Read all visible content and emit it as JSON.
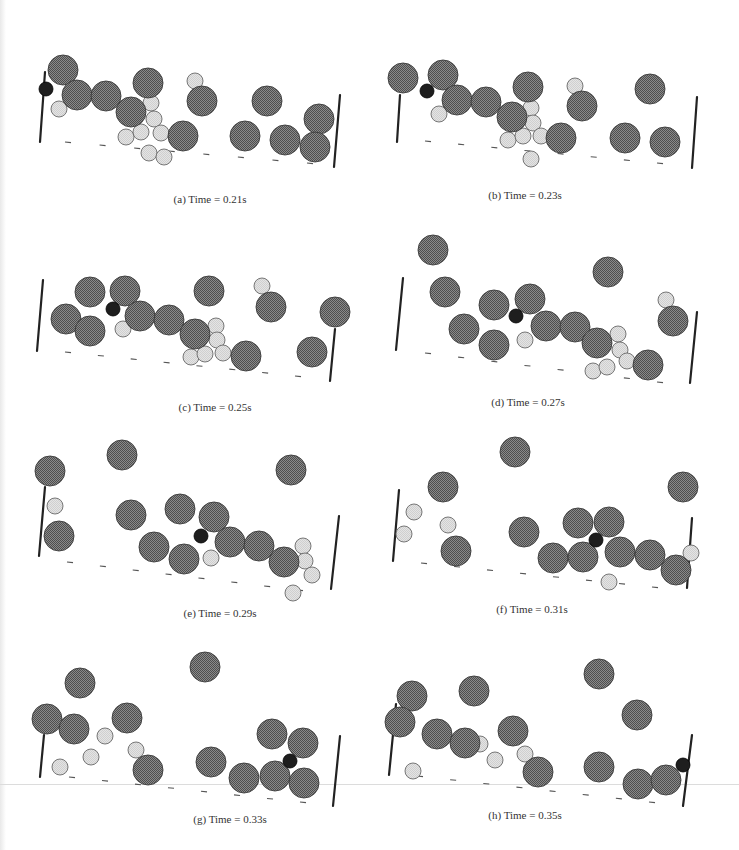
{
  "figure": {
    "colors": {
      "large_fill": "#6e6e6e",
      "large_stroke": "#3a3a3a",
      "small_fill": "#dcdcdc",
      "small_stroke": "#6a6a6a",
      "tracer_fill": "#1e1e1e",
      "wall": "#222222",
      "dash": "#555555"
    },
    "radii": {
      "large": 15,
      "small": 8,
      "tracer": 7
    },
    "panels": [
      {
        "id": "a",
        "caption": "(a) Time = 0.21s",
        "caption_pos": [
          210,
          200
        ],
        "walls": [
          [
            45,
            72,
            40,
            142
          ],
          [
            340,
            95,
            334,
            167
          ]
        ],
        "ground": [
          [
            68,
            142
          ],
          [
            310,
            163
          ]
        ],
        "large": [
          [
            63,
            70
          ],
          [
            77,
            95
          ],
          [
            106,
            96
          ],
          [
            131,
            112
          ],
          [
            148,
            83
          ],
          [
            202,
            101
          ],
          [
            183,
            136
          ],
          [
            245,
            136
          ],
          [
            267,
            101
          ],
          [
            285,
            140
          ],
          [
            319,
            119
          ],
          [
            315,
            147
          ]
        ],
        "small": [
          [
            59,
            109
          ],
          [
            151,
            103
          ],
          [
            154,
            119
          ],
          [
            126,
            137
          ],
          [
            141,
            132
          ],
          [
            161,
            133
          ],
          [
            195,
            81
          ],
          [
            149,
            153
          ],
          [
            164,
            157
          ]
        ],
        "tracer": [
          [
            46,
            89
          ]
        ]
      },
      {
        "id": "b",
        "caption": "(b) Time = 0.23s",
        "caption_pos": [
          525,
          196
        ],
        "walls": [
          [
            400,
            95,
            397,
            142
          ],
          [
            697,
            97,
            692,
            168
          ]
        ],
        "ground": [
          [
            428,
            141
          ],
          [
            660,
            163
          ]
        ],
        "large": [
          [
            403,
            78
          ],
          [
            443,
            75
          ],
          [
            457,
            100
          ],
          [
            486,
            102
          ],
          [
            512,
            117
          ],
          [
            528,
            87
          ],
          [
            561,
            138
          ],
          [
            582,
            106
          ],
          [
            625,
            138
          ],
          [
            650,
            89
          ],
          [
            665,
            142
          ]
        ],
        "small": [
          [
            439,
            114
          ],
          [
            531,
            108
          ],
          [
            533,
            123
          ],
          [
            508,
            140
          ],
          [
            523,
            136
          ],
          [
            541,
            136
          ],
          [
            575,
            86
          ],
          [
            531,
            159
          ]
        ],
        "tracer": [
          [
            427,
            91
          ]
        ]
      },
      {
        "id": "c",
        "caption": "(c) Time = 0.25s",
        "caption_pos": [
          215,
          408
        ],
        "walls": [
          [
            43,
            280,
            37,
            351
          ],
          [
            335,
            329,
            330,
            381
          ]
        ],
        "ground": [
          [
            68,
            352
          ],
          [
            298,
            376
          ]
        ],
        "large": [
          [
            90,
            292
          ],
          [
            125,
            291
          ],
          [
            66,
            319
          ],
          [
            90,
            331
          ],
          [
            140,
            316
          ],
          [
            169,
            320
          ],
          [
            195,
            334
          ],
          [
            209,
            291
          ],
          [
            271,
            307
          ],
          [
            335,
            312
          ],
          [
            246,
            356
          ],
          [
            312,
            352
          ]
        ],
        "small": [
          [
            123,
            329
          ],
          [
            216,
            326
          ],
          [
            217,
            340
          ],
          [
            191,
            357
          ],
          [
            205,
            354
          ],
          [
            223,
            353
          ],
          [
            262,
            286
          ]
        ],
        "tracer": [
          [
            113,
            309
          ]
        ]
      },
      {
        "id": "d",
        "caption": "(d) Time = 0.27s",
        "caption_pos": [
          528,
          403
        ],
        "walls": [
          [
            403,
            278,
            396,
            350
          ],
          [
            697,
            312,
            690,
            383
          ]
        ],
        "ground": [
          [
            428,
            353
          ],
          [
            660,
            382
          ]
        ],
        "large": [
          [
            433,
            250
          ],
          [
            445,
            292
          ],
          [
            494,
            305
          ],
          [
            530,
            299
          ],
          [
            464,
            329
          ],
          [
            494,
            345
          ],
          [
            546,
            326
          ],
          [
            575,
            327
          ],
          [
            597,
            343
          ],
          [
            608,
            272
          ],
          [
            648,
            365
          ],
          [
            673,
            321
          ]
        ],
        "small": [
          [
            525,
            340
          ],
          [
            618,
            334
          ],
          [
            620,
            350
          ],
          [
            627,
            361
          ],
          [
            593,
            371
          ],
          [
            607,
            367
          ],
          [
            666,
            300
          ]
        ],
        "tracer": [
          [
            516,
            316
          ]
        ]
      },
      {
        "id": "e",
        "caption": "(e) Time = 0.29s",
        "caption_pos": [
          220,
          614
        ],
        "walls": [
          [
            45,
            487,
            39,
            556
          ],
          [
            339,
            516,
            331,
            589
          ]
        ],
        "ground": [
          [
            70,
            562
          ],
          [
            300,
            590
          ]
        ],
        "large": [
          [
            50,
            471
          ],
          [
            122,
            455
          ],
          [
            59,
            536
          ],
          [
            131,
            515
          ],
          [
            180,
            509
          ],
          [
            214,
            517
          ],
          [
            154,
            547
          ],
          [
            184,
            559
          ],
          [
            230,
            542
          ],
          [
            259,
            546
          ],
          [
            284,
            562
          ],
          [
            291,
            470
          ]
        ],
        "small": [
          [
            55,
            506
          ],
          [
            211,
            558
          ],
          [
            303,
            546
          ],
          [
            305,
            561
          ],
          [
            312,
            575
          ],
          [
            293,
            593
          ]
        ],
        "tracer": [
          [
            201,
            536
          ]
        ]
      },
      {
        "id": "f",
        "caption": "(f) Time = 0.31s",
        "caption_pos": [
          532,
          610
        ],
        "walls": [
          [
            399,
            490,
            393,
            561
          ],
          [
            692,
            518,
            687,
            588
          ]
        ],
        "ground": [
          [
            424,
            563
          ],
          [
            655,
            587
          ]
        ],
        "large": [
          [
            515,
            452
          ],
          [
            443,
            487
          ],
          [
            456,
            551
          ],
          [
            524,
            532
          ],
          [
            553,
            558
          ],
          [
            578,
            523
          ],
          [
            583,
            557
          ],
          [
            609,
            522
          ],
          [
            620,
            552
          ],
          [
            650,
            555
          ],
          [
            676,
            570
          ],
          [
            683,
            487
          ]
        ],
        "small": [
          [
            414,
            512
          ],
          [
            404,
            534
          ],
          [
            448,
            525
          ],
          [
            609,
            582
          ],
          [
            691,
            553
          ]
        ],
        "tracer": [
          [
            596,
            540
          ]
        ]
      },
      {
        "id": "g",
        "caption": "(g) Time = 0.33s",
        "caption_pos": [
          230,
          820
        ],
        "walls": [
          [
            44,
            735,
            40,
            777
          ],
          [
            340,
            736,
            333,
            806
          ]
        ],
        "ground": [
          [
            72,
            777
          ],
          [
            303,
            802
          ]
        ],
        "large": [
          [
            80,
            683
          ],
          [
            47,
            719
          ],
          [
            74,
            729
          ],
          [
            127,
            718
          ],
          [
            148,
            770
          ],
          [
            205,
            667
          ],
          [
            211,
            762
          ],
          [
            244,
            778
          ],
          [
            272,
            734
          ],
          [
            275,
            776
          ],
          [
            303,
            743
          ],
          [
            304,
            783
          ]
        ],
        "small": [
          [
            60,
            767
          ],
          [
            91,
            757
          ],
          [
            105,
            736
          ],
          [
            136,
            750
          ]
        ],
        "tracer": [
          [
            290,
            761
          ]
        ]
      },
      {
        "id": "h",
        "caption": "(h) Time = 0.35s",
        "caption_pos": [
          525,
          816
        ],
        "walls": [
          [
            396,
            704,
            389,
            775
          ],
          [
            692,
            735,
            683,
            806
          ]
        ],
        "ground": [
          [
            420,
            776
          ],
          [
            652,
            802
          ]
        ],
        "large": [
          [
            412,
            696
          ],
          [
            400,
            722
          ],
          [
            437,
            734
          ],
          [
            465,
            743
          ],
          [
            474,
            691
          ],
          [
            513,
            731
          ],
          [
            538,
            772
          ],
          [
            599,
            674
          ],
          [
            599,
            767
          ],
          [
            637,
            715
          ],
          [
            638,
            784
          ],
          [
            666,
            780
          ]
        ],
        "small": [
          [
            413,
            771
          ],
          [
            480,
            744
          ],
          [
            495,
            760
          ],
          [
            525,
            754
          ]
        ],
        "tracer": [
          [
            683,
            765
          ]
        ]
      }
    ]
  }
}
